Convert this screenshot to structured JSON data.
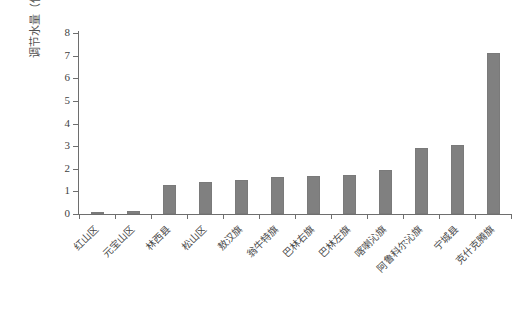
{
  "chart_data": {
    "type": "bar",
    "title": "",
    "subtitle": "",
    "xlabel": "",
    "ylabel": "调节水量（亿立方米/年）",
    "ylim": [
      0,
      8
    ],
    "ytick_values": [
      0,
      1,
      2,
      3,
      4,
      5,
      6,
      7,
      8
    ],
    "ytick_labels": [
      "0",
      "1",
      "2",
      "3",
      "4",
      "5",
      "6",
      "7",
      "8"
    ],
    "grid": false,
    "legend": null,
    "bar_color": "#808080",
    "axis_color": "#6e6e6e",
    "categories": [
      "红山区",
      "元宝山区",
      "林西县",
      "松山区",
      "敖汉旗",
      "翁牛特旗",
      "巴林右旗",
      "巴林左旗",
      "喀喇沁旗",
      "阿鲁科尔沁旗",
      "宁城县",
      "克什克腾旗"
    ],
    "values": [
      0.05,
      0.12,
      1.3,
      1.4,
      1.5,
      1.62,
      1.7,
      1.72,
      1.95,
      2.92,
      3.05,
      7.1
    ]
  }
}
